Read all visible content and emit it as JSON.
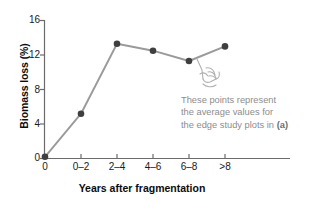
{
  "chart_data": {
    "type": "line",
    "title": "",
    "xlabel": "Years after fragmentation",
    "ylabel": "Biomass loss (%)",
    "categories": [
      "0",
      "0–2",
      "2–4",
      "4–6",
      "6–8",
      ">8"
    ],
    "values": [
      0.2,
      5.2,
      13.3,
      12.5,
      11.3,
      13.0
    ],
    "ylim": [
      0,
      16
    ],
    "yticks": [
      0,
      4,
      8,
      12,
      16
    ],
    "ytick_labels": [
      "0",
      "4",
      "8",
      "12",
      "16"
    ],
    "grid": false,
    "legend": false,
    "marker": "filled-circle",
    "marker_color": "#3f3f3f",
    "line_color": "#9a9a9a",
    "axis_color": "#6b6b6b"
  },
  "annotation": {
    "line1": "These points represent",
    "line2": "the average values for",
    "line3_prefix": "the edge study plots in ",
    "line3_bold": "(a)",
    "color": "#8d8d8d"
  },
  "pointer": {
    "icon": "pointing-hand-icon"
  }
}
